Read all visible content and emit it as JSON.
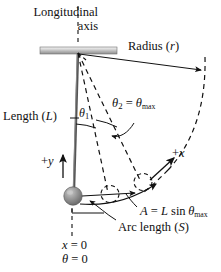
{
  "figure": {
    "background_color": "#ffffff",
    "stroke_color": "#111111"
  },
  "labels": {
    "longitudinal_axis": "Longitudinal\naxis",
    "longitudinal_axis_line1": "Longitudinal",
    "longitudinal_axis_line2": "axis",
    "radius_text": "Radius (",
    "radius_symbol": "r",
    "radius_close": ")",
    "theta2_text": "θ",
    "theta2_sub": "2",
    "theta2_equals": " = ",
    "theta_max_symbol": "θ",
    "theta_max_sub": "max",
    "length_text": "Length (",
    "length_symbol": "L",
    "length_close": ")",
    "theta1_text": "θ",
    "theta1_sub": "1",
    "plus_y": "+",
    "plus_y_symbol": "y",
    "plus_x": "+",
    "plus_x_symbol": "x",
    "amplitude_A": "A",
    "amplitude_eq": " = ",
    "amplitude_L": "L",
    "amplitude_sin": " sin ",
    "amplitude_theta": "θ",
    "amplitude_sub": "max",
    "arc_length_text": "Arc length (",
    "arc_length_symbol": "S",
    "arc_length_close": ")",
    "x_zero_symbol": "x",
    "x_zero_rest": " = 0",
    "theta_zero_symbol": "θ",
    "theta_zero_rest": " = 0"
  },
  "geometry": {
    "pivot_x": 78,
    "pivot_y": 53,
    "rod_length": 143,
    "bob_x": 73,
    "bob_y": 196,
    "bob_radius": 9,
    "theta1_degrees": 12,
    "theta2_degrees": 26,
    "support_bar_left": 40,
    "support_bar_right": 117,
    "support_bar_top": 47,
    "support_bar_height": 7
  },
  "colors": {
    "support_bar_light": "#e8e8e8",
    "support_bar_dark": "#9a9a9a",
    "bob_light": "#b8b8b8",
    "bob_dark": "#6e6e6e",
    "line": "#111111"
  }
}
